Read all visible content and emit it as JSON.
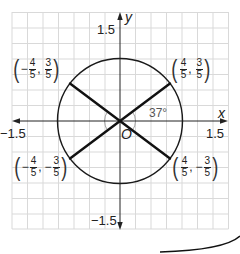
{
  "diagram": {
    "type": "unit-circle-with-diameters",
    "axes": {
      "x_label": "x",
      "y_label": "y",
      "origin_label": "O",
      "tick_labels": {
        "x_min": "−1.5",
        "x_max": "1.5",
        "y_max": "1.5",
        "y_min": "−1.5"
      },
      "range": [
        -1.5,
        1.5
      ]
    },
    "circle": {
      "center": [
        0,
        0
      ],
      "radius": 1
    },
    "angle_label": "37°",
    "points": [
      {
        "id": "q1",
        "x_sign": "",
        "x_num": "4",
        "x_den": "5",
        "y_sign": "",
        "y_num": "3",
        "y_den": "5"
      },
      {
        "id": "q2",
        "x_sign": "−",
        "x_num": "4",
        "x_den": "5",
        "y_sign": "",
        "y_num": "3",
        "y_den": "5"
      },
      {
        "id": "q3",
        "x_sign": "−",
        "x_num": "4",
        "x_den": "5",
        "y_sign": "−",
        "y_num": "3",
        "y_den": "5"
      },
      {
        "id": "q4",
        "x_sign": "",
        "x_num": "4",
        "x_den": "5",
        "y_sign": "−",
        "y_num": "3",
        "y_den": "5"
      }
    ],
    "colors": {
      "grid": "#d9d9d9",
      "axes": "#222222",
      "circle": "#1a1a1a",
      "segments": "#111111",
      "angle_arc": "#9a9a9a"
    }
  }
}
